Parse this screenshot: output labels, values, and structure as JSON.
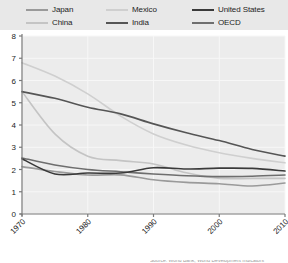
{
  "legend": {
    "position": "top",
    "background": "#e8e8e8",
    "items": [
      {
        "label": "Japan",
        "color": "#9a9a9a",
        "col": 0,
        "row": 0
      },
      {
        "label": "China",
        "color": "#c4c4c4",
        "col": 0,
        "row": 1
      },
      {
        "label": "Mexico",
        "color": "#cfcfcf",
        "col": 1,
        "row": 0
      },
      {
        "label": "India",
        "color": "#555555",
        "col": 1,
        "row": 1
      },
      {
        "label": "United States",
        "color": "#3a3a3a",
        "col": 2,
        "row": 0
      },
      {
        "label": "OECD",
        "color": "#6e6e6e",
        "col": 2,
        "row": 1
      }
    ]
  },
  "axes": {
    "y_ticks": [
      "0",
      "1",
      "2",
      "3",
      "4",
      "5",
      "6",
      "7",
      "8"
    ],
    "x_ticks": [
      "1970",
      "1980",
      "1990",
      "2000",
      "2010"
    ],
    "x_tick_rotation": "-45",
    "plot_background": "#ececec",
    "grid_color": "#f7f7f7",
    "axis_color": "#7a7a7a"
  },
  "caption": {
    "sliver_text": "Source: World Bank, World Development Indicators"
  },
  "chart_data": {
    "type": "line",
    "title": "",
    "subtitle": "",
    "xlabel": "",
    "ylabel": "",
    "xlim": [
      1970,
      2010
    ],
    "ylim": [
      0,
      8
    ],
    "grid": true,
    "legend_position": "top",
    "x": [
      1970,
      1975,
      1980,
      1985,
      1990,
      1995,
      2000,
      2005,
      2010
    ],
    "series": [
      {
        "name": "Mexico",
        "color": "#cfcfcf",
        "values": [
          6.8,
          6.2,
          5.4,
          4.4,
          3.6,
          3.1,
          2.75,
          2.5,
          2.3
        ]
      },
      {
        "name": "India",
        "color": "#555555",
        "values": [
          5.5,
          5.2,
          4.8,
          4.5,
          4.05,
          3.65,
          3.3,
          2.9,
          2.6
        ]
      },
      {
        "name": "China",
        "color": "#c4c4c4",
        "values": [
          5.5,
          3.6,
          2.6,
          2.4,
          2.25,
          1.85,
          1.6,
          1.6,
          1.6
        ]
      },
      {
        "name": "United States",
        "color": "#3a3a3a",
        "values": [
          2.48,
          1.8,
          1.84,
          1.84,
          2.08,
          2.02,
          2.06,
          2.05,
          1.93
        ]
      },
      {
        "name": "OECD",
        "color": "#6e6e6e",
        "values": [
          2.52,
          2.2,
          2.0,
          1.9,
          1.8,
          1.72,
          1.68,
          1.7,
          1.75
        ]
      },
      {
        "name": "Japan",
        "color": "#9a9a9a",
        "values": [
          2.13,
          1.91,
          1.75,
          1.76,
          1.54,
          1.42,
          1.36,
          1.26,
          1.39
        ]
      }
    ]
  }
}
